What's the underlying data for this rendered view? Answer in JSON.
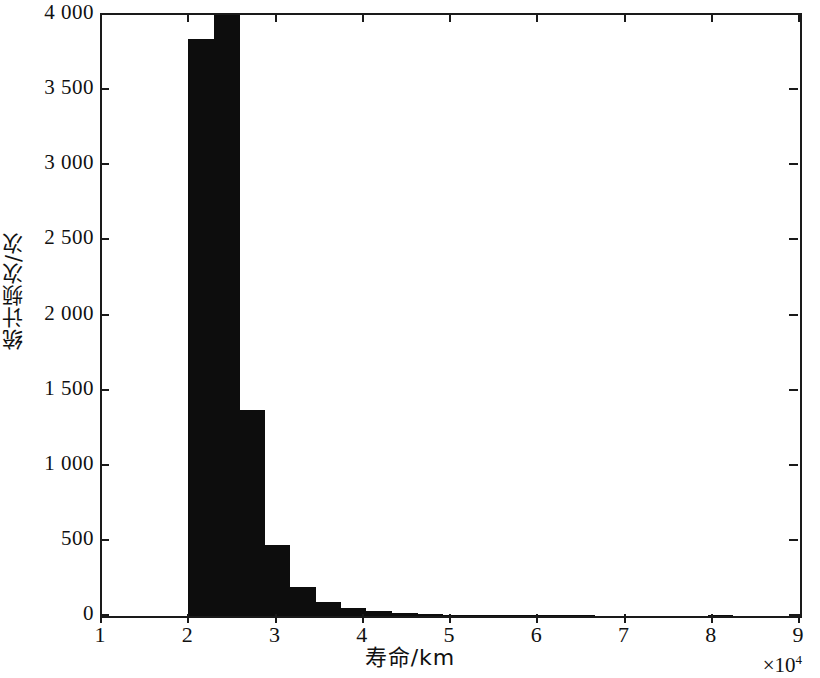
{
  "chart_data": {
    "type": "bar",
    "title": "",
    "subtitle": "",
    "xlabel": "寿命/km",
    "ylabel": "统计频次/次",
    "x_multiplier_text": "×10",
    "x_multiplier_exponent": "4",
    "xlim": [
      1,
      9
    ],
    "ylim": [
      0,
      4000
    ],
    "xticks": [
      1,
      2,
      3,
      4,
      5,
      6,
      7,
      8,
      9
    ],
    "xtick_labels": [
      "1",
      "2",
      "3",
      "4",
      "5",
      "6",
      "7",
      "8",
      "9"
    ],
    "yticks": [
      0,
      500,
      1000,
      1500,
      2000,
      2500,
      3000,
      3500,
      4000
    ],
    "ytick_labels": [
      "0",
      "500",
      "1 000",
      "1 500",
      "2 000",
      "2 500",
      "3 000",
      "3 500",
      "4 000"
    ],
    "grid": false,
    "legend": null,
    "bar_color": "#0d0d0d",
    "bin_width": 0.29,
    "note": "Histogram of bearing life; second bar is clipped at the 4000 axis maximum",
    "bins": [
      {
        "x0": 1.99,
        "x1": 2.28,
        "value": 3840
      },
      {
        "x0": 2.28,
        "x1": 2.58,
        "value": 4100
      },
      {
        "x0": 2.58,
        "x1": 2.87,
        "value": 1370
      },
      {
        "x0": 2.87,
        "x1": 3.16,
        "value": 470
      },
      {
        "x0": 3.16,
        "x1": 3.45,
        "value": 195
      },
      {
        "x0": 3.45,
        "x1": 3.74,
        "value": 95
      },
      {
        "x0": 3.74,
        "x1": 4.03,
        "value": 55
      },
      {
        "x0": 4.03,
        "x1": 4.32,
        "value": 35
      },
      {
        "x0": 4.32,
        "x1": 4.62,
        "value": 22
      },
      {
        "x0": 4.62,
        "x1": 4.91,
        "value": 14
      },
      {
        "x0": 4.91,
        "x1": 5.2,
        "value": 10
      },
      {
        "x0": 5.2,
        "x1": 5.49,
        "value": 7
      },
      {
        "x0": 5.49,
        "x1": 5.78,
        "value": 7
      },
      {
        "x0": 5.78,
        "x1": 6.07,
        "value": 5
      },
      {
        "x0": 6.07,
        "x1": 6.36,
        "value": 3
      },
      {
        "x0": 6.36,
        "x1": 6.65,
        "value": 3
      },
      {
        "x0": 7.94,
        "x1": 8.23,
        "value": 10
      }
    ]
  }
}
